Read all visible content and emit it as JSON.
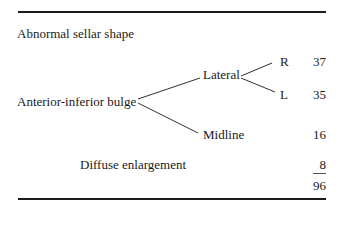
{
  "table": {
    "heading": "Abnormal sellar shape",
    "tree": {
      "root": "Anterior-inferior bulge",
      "lateral": "Lateral",
      "right": "R",
      "left": "L",
      "midline": "Midline"
    },
    "diffuse": "Diffuse enlargement",
    "counts": {
      "right": "37",
      "left": "35",
      "midline": "16",
      "diffuse": "8",
      "total": "96"
    }
  }
}
